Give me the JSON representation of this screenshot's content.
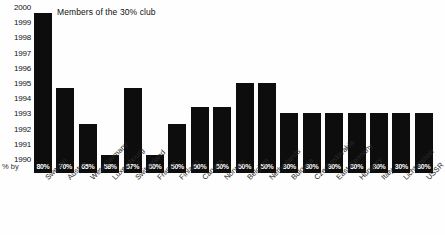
{
  "chart_data": {
    "type": "bar",
    "title": "Members of the 30% club",
    "xlabel": "",
    "ylabel": "",
    "ylim": [
      1989.5,
      2000.4
    ],
    "grid": false,
    "legend": null,
    "yticks": [
      "2000",
      "1999",
      "1998",
      "1997",
      "1996",
      "1995",
      "1994",
      "1993",
      "1992",
      "1991",
      "1990"
    ],
    "percent_row_label": "% by",
    "categories": [
      "Sweden",
      "Austria",
      "West Germany",
      "Luxembourg",
      "Switzerland",
      "France",
      "Finland",
      "Canada",
      "Norway",
      "Belgium",
      "Netherlands",
      "Bulgaria",
      "Czechoslovakia",
      "East Germany",
      "Hungary",
      "Italy",
      "Lichtenstein",
      "USSR"
    ],
    "percent_labels": [
      "80%",
      "70%",
      "65%",
      "58%",
      "57%",
      "50%",
      "50%",
      "50%",
      "50%",
      "50%",
      "50%",
      "30%",
      "30%",
      "30%",
      "30%",
      "30%",
      "30%",
      "30%"
    ],
    "values": [
      1999.7,
      1994.7,
      1992.3,
      1990.2,
      1994.7,
      1990.2,
      1992.3,
      1993.4,
      1993.4,
      1995.0,
      1995.0,
      1993.0,
      1993.0,
      1993.0,
      1993.0,
      1993.0,
      1993.0,
      1993.0
    ],
    "series": [
      {
        "name": "Target year",
        "values": [
          1999.7,
          1994.7,
          1992.3,
          1990.2,
          1994.7,
          1990.2,
          1992.3,
          1993.4,
          1993.4,
          1995.0,
          1995.0,
          1993.0,
          1993.0,
          1993.0,
          1993.0,
          1993.0,
          1993.0,
          1993.0
        ]
      }
    ],
    "bar_color": "#0d0d0d",
    "background_color": "#fefefe"
  }
}
